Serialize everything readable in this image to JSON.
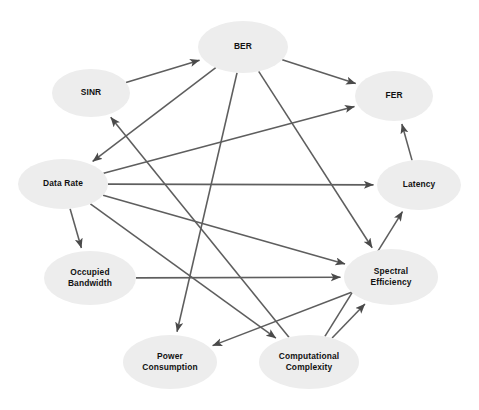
{
  "diagram": {
    "type": "directed-graph",
    "background_color": "#ffffff",
    "node_fill_color": "#ededed",
    "node_text_color": "#111111",
    "edge_color": "#5e5e5e",
    "nodes": [
      {
        "id": "ber",
        "label": "BER",
        "cx": 243,
        "cy": 47,
        "rx": 45,
        "ry": 26,
        "lines": [
          "BER"
        ]
      },
      {
        "id": "sinr",
        "label": "SINR",
        "cx": 91,
        "cy": 93,
        "rx": 39,
        "ry": 24,
        "lines": [
          "SINR"
        ]
      },
      {
        "id": "fer",
        "label": "FER",
        "cx": 394,
        "cy": 96,
        "rx": 39,
        "ry": 25,
        "lines": [
          "FER"
        ]
      },
      {
        "id": "datarate",
        "label": "Data Rate",
        "cx": 63,
        "cy": 184,
        "rx": 45,
        "ry": 25,
        "lines": [
          "Data Rate"
        ]
      },
      {
        "id": "latency",
        "label": "Latency",
        "cx": 419,
        "cy": 185,
        "rx": 42,
        "ry": 25,
        "lines": [
          "Latency"
        ]
      },
      {
        "id": "obw",
        "label": "Occupied Bandwidth",
        "cx": 90,
        "cy": 278,
        "rx": 46,
        "ry": 27,
        "lines": [
          "Occupied",
          "Bandwidth"
        ]
      },
      {
        "id": "spectral",
        "label": "Spectral Efficiency",
        "cx": 391,
        "cy": 277,
        "rx": 47,
        "ry": 28,
        "lines": [
          "Spectral",
          "Efficiency"
        ]
      },
      {
        "id": "power",
        "label": "Power Consumption",
        "cx": 170,
        "cy": 362,
        "rx": 47,
        "ry": 27,
        "lines": [
          "Power",
          "Consumption"
        ]
      },
      {
        "id": "comp",
        "label": "Computational Complexity",
        "cx": 309,
        "cy": 362,
        "rx": 50,
        "ry": 27,
        "lines": [
          "Computational",
          "Complexity"
        ]
      }
    ],
    "edges": [
      {
        "source": "sinr",
        "target": "ber",
        "label": "SINR to BER"
      },
      {
        "source": "ber",
        "target": "fer",
        "label": "BER to FER"
      },
      {
        "source": "ber",
        "target": "datarate",
        "label": "BER to Data Rate"
      },
      {
        "source": "ber",
        "target": "power",
        "label": "BER to Power Consumption"
      },
      {
        "source": "ber",
        "target": "spectral",
        "label": "BER to Spectral Efficiency"
      },
      {
        "source": "datarate",
        "target": "fer",
        "label": "Data Rate to FER"
      },
      {
        "source": "datarate",
        "target": "latency",
        "label": "Data Rate to Latency"
      },
      {
        "source": "datarate",
        "target": "obw",
        "label": "Data Rate to Occupied Bandwidth"
      },
      {
        "source": "datarate",
        "target": "spectral",
        "label": "Data Rate to Spectral Efficiency"
      },
      {
        "source": "datarate",
        "target": "comp",
        "label": "Data Rate to Computational Complexity"
      },
      {
        "source": "obw",
        "target": "spectral",
        "label": "Occupied Bandwidth to Spectral Efficiency"
      },
      {
        "source": "comp",
        "target": "sinr",
        "label": "Computational Complexity to SINR"
      },
      {
        "source": "comp",
        "target": "latency",
        "label": "Computational Complexity to Latency"
      },
      {
        "source": "comp",
        "target": "spectral",
        "label": "Computational Complexity to Spectral Efficiency"
      },
      {
        "source": "latency",
        "target": "fer",
        "label": "Latency to FER"
      },
      {
        "source": "spectral",
        "target": "power",
        "label": "Spectral Efficiency to Power Consumption"
      }
    ]
  }
}
